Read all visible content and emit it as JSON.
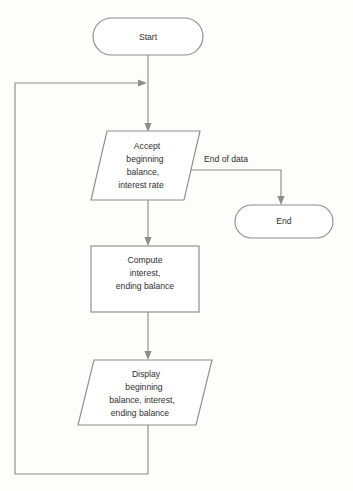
{
  "diagram": {
    "type": "flowchart",
    "colors": {
      "background": "#fdfdfc",
      "stroke": "#8d8d8d",
      "node_fill": "#ffffff",
      "text": "#2e2e2e"
    },
    "nodes": [
      {
        "id": "start",
        "shape": "terminator",
        "label": "Start",
        "lines": [
          "Start"
        ]
      },
      {
        "id": "accept",
        "shape": "parallelogram",
        "label": "Accept beginning balance, interest rate",
        "lines": [
          "Accept",
          "beginning",
          "balance,",
          "interest rate"
        ]
      },
      {
        "id": "end",
        "shape": "terminator",
        "label": "End",
        "lines": [
          "End"
        ]
      },
      {
        "id": "compute",
        "shape": "process",
        "label": "Compute interest, ending balance",
        "lines": [
          "Compute",
          "interest,",
          "ending balance"
        ]
      },
      {
        "id": "display",
        "shape": "parallelogram",
        "label": "Display beginning balance, interest, ending balance",
        "lines": [
          "Display",
          "beginning",
          "balance, interest,",
          "ending balance"
        ]
      }
    ],
    "edges": [
      {
        "id": "start-to-accept",
        "from": "start",
        "to": "accept",
        "label": ""
      },
      {
        "id": "accept-to-end",
        "from": "accept",
        "to": "end",
        "label": "End of data"
      },
      {
        "id": "accept-to-compute",
        "from": "accept",
        "to": "compute",
        "label": ""
      },
      {
        "id": "compute-to-display",
        "from": "compute",
        "to": "display",
        "label": ""
      },
      {
        "id": "display-to-accept-loop",
        "from": "display",
        "to": "accept",
        "label": ""
      }
    ],
    "edge_labels": {
      "end_of_data": "End of data"
    }
  }
}
